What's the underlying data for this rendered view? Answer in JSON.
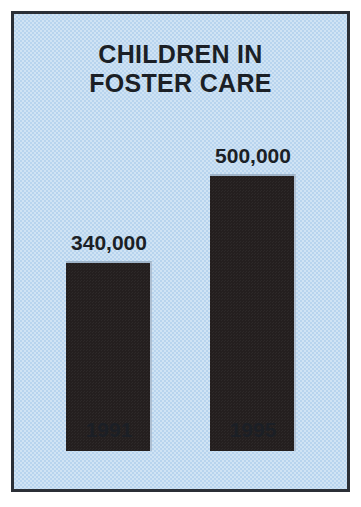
{
  "chart_data": {
    "type": "bar",
    "title": "CHILDREN IN FOSTER CARE",
    "title_lines": [
      "CHILDREN IN",
      "FOSTER CARE"
    ],
    "categories": [
      "1991",
      "1995"
    ],
    "values": [
      340000,
      500000
    ],
    "value_labels": [
      "340,000",
      "500,000"
    ],
    "xlabel": "",
    "ylabel": "",
    "ylim": [
      0,
      500000
    ],
    "grid": false,
    "legend": false,
    "series": [
      {
        "name": "Children in foster care",
        "values": [
          340000,
          500000
        ]
      }
    ],
    "bars": [
      {
        "category": "1991",
        "value": 340000,
        "value_label": "340,000",
        "height_px": 190,
        "left_px": 66,
        "width_px": 86
      },
      {
        "category": "1995",
        "value": 500000,
        "value_label": "500,000",
        "height_px": 277,
        "left_px": 210,
        "width_px": 86
      }
    ]
  },
  "colors": {
    "background": "#b8d4ee",
    "bar": "#241f1f",
    "text": "#1b1f26",
    "frame": "#2b2f36",
    "bevel_highlight": "#9fb4c9",
    "page": "#ffffff"
  }
}
